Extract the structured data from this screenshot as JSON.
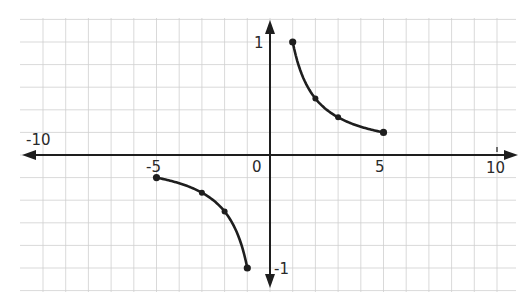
{
  "chart_data": {
    "type": "line",
    "title": "",
    "xlabel": "",
    "ylabel": "",
    "function": "y = 1/x",
    "xlim": [
      -10,
      10
    ],
    "ylim": [
      -1,
      1
    ],
    "grid": true,
    "x_tick_labels": [
      "-10",
      "-5",
      "0",
      "5",
      "10"
    ],
    "y_tick_labels": [
      "1",
      "-1"
    ],
    "series": [
      {
        "name": "positive branch",
        "points": [
          [
            1,
            1
          ],
          [
            2,
            0.5
          ],
          [
            3,
            0.333
          ],
          [
            5,
            0.2
          ]
        ]
      },
      {
        "name": "negative branch",
        "points": [
          [
            -5,
            -0.2
          ],
          [
            -3,
            -0.333
          ],
          [
            -2,
            -0.5
          ],
          [
            -1,
            -1
          ]
        ]
      }
    ]
  },
  "labels": {
    "x_neg10": "-10",
    "x_neg5": "-5",
    "x_0": "0",
    "x_5": "5",
    "x_10": "10",
    "y_1": "1",
    "y_neg1": "-1"
  },
  "colors": {
    "grid": "#cfcfcf",
    "axis": "#1e1e1e",
    "curve": "#1e1e1e"
  }
}
